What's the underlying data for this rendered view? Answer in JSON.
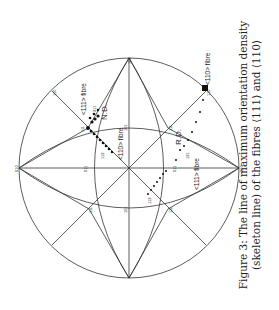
{
  "figure": {
    "number": "Figure 3:",
    "caption_line1": "The line of maximum orientation density",
    "caption_line2": "(skeleton line) of the fibres ⟨111⟩ and ⟨110⟩",
    "orientation": "rotated 90° counter-clockwise"
  },
  "projection": {
    "type": "stereographic projection (cubic)",
    "center_pole": "001",
    "poles": [
      {
        "label": "100",
        "pos": "top"
      },
      {
        "label": "010",
        "pos": "left"
      },
      {
        "label": "010",
        "pos": "right"
      },
      {
        "label": "111",
        "pos": "upper-left"
      },
      {
        "label": "111",
        "pos": "upper-right"
      },
      {
        "label": "111",
        "pos": "lower-left"
      },
      {
        "label": "111",
        "pos": "lower-right"
      },
      {
        "label": "101",
        "pos": "upper-middle"
      },
      {
        "label": "101",
        "pos": "lower-middle"
      },
      {
        "label": "011",
        "pos": "left-middle"
      },
      {
        "label": "011",
        "pos": "right-middle"
      },
      {
        "label": "110",
        "pos": "upper-left-rim"
      },
      {
        "label": "110",
        "pos": "upper-right-rim"
      },
      {
        "label": "112",
        "pos": "upper-left-inner"
      },
      {
        "label": "112",
        "pos": "lower-right-inner"
      },
      {
        "label": "211",
        "pos": "near-ND"
      },
      {
        "label": "121",
        "pos": "near-RD"
      }
    ],
    "annotations": {
      "fibre_111_upper": "<111> fibre",
      "fibre_110_center": "<110> fibre",
      "fibre_110_rim": "<110> fibre",
      "fibre_111_lower": "<111> fibre",
      "nd": "N.D.",
      "rd": "R.D."
    }
  }
}
